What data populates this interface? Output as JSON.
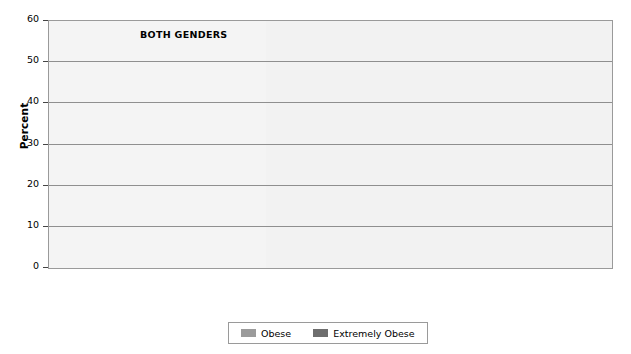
{
  "chart_data": {
    "type": "bar",
    "title": "",
    "xlabel": "",
    "ylabel": "Percent",
    "ylim": [
      0,
      60
    ],
    "yticks": [
      0,
      10,
      20,
      30,
      40,
      50,
      60
    ],
    "grid": true,
    "legend_position": "bottom-center",
    "legend": [
      "Obese",
      "Extremely Obese"
    ],
    "colors": {
      "obese": "#9b9b9b",
      "extremely_obese": "#6e6e6e",
      "plot_light_background": "#f4f4f4",
      "plot_dark_background": "#dcdcdc",
      "axis": "#9a9a9a",
      "gridline": "#8f8f8f"
    },
    "sections": [
      {
        "name": "BOTH GENDERS",
        "shade": "light",
        "categories": [
          "Asian",
          "Black",
          "Latino",
          "American\nIndian/\nAlaska Native",
          "White"
        ],
        "series": [
          {
            "name": "Obese",
            "values": [
              12.6,
              48.4,
              42.6,
              42.3,
              36.4
            ],
            "labels": [
              "12.6%",
              "48.4%",
              "42.6%",
              "42.3%",
              "36.4%"
            ]
          },
          {
            "name": "Extremely Obese",
            "values": [
              null,
              12.4,
              7.1,
              null,
              7.6
            ],
            "labels": [
              "N/A",
              "12.4%",
              "7.1%",
              "Unknown",
              "7.6%"
            ]
          }
        ]
      },
      {
        "name": "MEN",
        "shade": "dark",
        "categories": [
          "Asian",
          "Black",
          "Latino",
          "White"
        ],
        "series": [
          {
            "name": "Obese",
            "values": [
              12.6,
              38.0,
              37.9,
              34.7
            ],
            "labels": [
              "12.6%",
              "38.0%",
              "37.9%",
              "34.7%"
            ]
          },
          {
            "name": "Extremely Obese",
            "values": [
              null,
              7.2,
              5.4,
              5.6
            ],
            "labels": [
              "N/A",
              "7.2%",
              "5.4%",
              "5.6%"
            ]
          }
        ]
      },
      {
        "name": "WOMEN",
        "shade": "dark",
        "categories": [
          "Asian",
          "Black",
          "Latino",
          "White"
        ],
        "series": [
          {
            "name": "Obese",
            "values": [
              12.4,
              57.2,
              46.9,
              38.2
            ],
            "labels": [
              "12.4%",
              "57.2%",
              "46.9%",
              "38.2%"
            ]
          },
          {
            "name": "Extremely Obese",
            "values": [
              null,
              16.8,
              8.7,
              9.7
            ],
            "labels": [
              "N/A",
              "16.8%",
              "8.7%",
              "9.7%"
            ]
          }
        ]
      }
    ]
  }
}
